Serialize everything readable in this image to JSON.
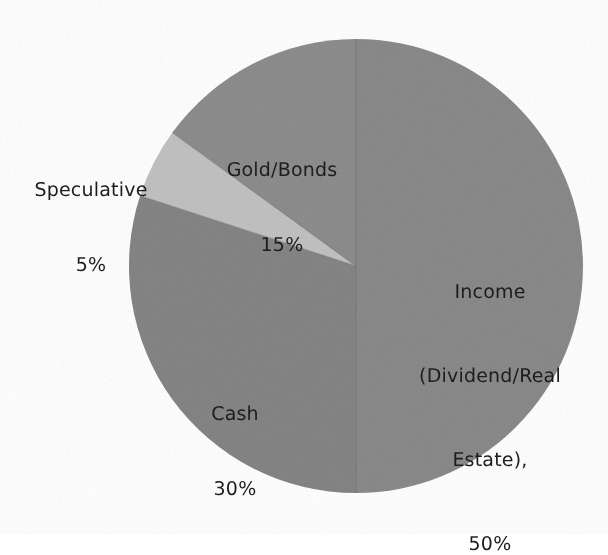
{
  "background_color": "#ffffff",
  "chart_data": {
    "type": "pie",
    "title": "",
    "subtitle": "",
    "xlabel": "",
    "ylabel": "",
    "legend_position": "none",
    "grid": false,
    "label_position": "inside-and-outside",
    "start_angle_deg": 0,
    "direction": "clockwise",
    "total": 100,
    "value_unit": "%",
    "categories": [
      "Income (Dividend/Real Estate),",
      "Cash",
      "Speculative",
      "Gold/Bonds"
    ],
    "values": [
      50,
      30,
      5,
      15
    ],
    "slices": [
      {
        "id": "income",
        "name": "Income (Dividend/Real Estate),",
        "label_lines": [
          "Income",
          "(Dividend/Real",
          "Estate),",
          "50%"
        ],
        "value": 50,
        "value_label": "50%",
        "color": "#8a8a8a",
        "start_deg": 0,
        "end_deg": 180
      },
      {
        "id": "cash",
        "name": "Cash",
        "label_lines": [
          "Cash",
          "30%"
        ],
        "value": 30,
        "value_label": "30%",
        "color": "#858585",
        "start_deg": 180,
        "end_deg": 288
      },
      {
        "id": "speculative",
        "name": "Speculative",
        "label_lines": [
          "Speculative",
          "5%"
        ],
        "value": 5,
        "value_label": "5%",
        "color": "#c2c2c2",
        "start_deg": 288,
        "end_deg": 306
      },
      {
        "id": "goldbonds",
        "name": "Gold/Bonds",
        "label_lines": [
          "Gold/Bonds",
          "15%"
        ],
        "value": 15,
        "value_label": "15%",
        "color": "#8d8d8d",
        "start_deg": 306,
        "end_deg": 360
      }
    ]
  },
  "labels": {
    "speculative": {
      "name": "Speculative",
      "value": "5%"
    },
    "goldbonds": {
      "name": "Gold/Bonds",
      "value": "15%"
    },
    "income": {
      "line1": "Income",
      "line2": "(Dividend/Real",
      "line3": "Estate),",
      "value": "50%"
    },
    "cash": {
      "name": "Cash",
      "value": "30%"
    }
  },
  "geometry": {
    "center_x": 356,
    "center_y": 266,
    "radius": 227
  },
  "text_color": "#1d1d1d"
}
